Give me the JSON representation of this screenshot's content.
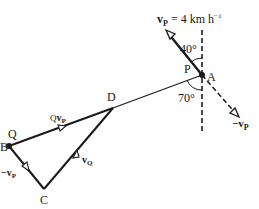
{
  "diagram": {
    "points": {
      "A": "A",
      "P": "P",
      "B": "B",
      "Q": "Q",
      "C": "C",
      "D": "D"
    },
    "labels": {
      "vp_eq_main": "v",
      "vp_eq_sub": "P",
      "vp_eq_value": " = 4 km h",
      "vp_eq_exp": "−1",
      "angle_top": "40°",
      "angle_bottom": "70°",
      "neg_vp_right_main": "−v",
      "neg_vp_right_sub": "P",
      "qvp_pre": "Q",
      "qvp_main": "v",
      "qvp_sub": "P",
      "vq_main": "v",
      "vq_sub": "Q",
      "neg_vp_left_main": "−v",
      "neg_vp_left_sub": "P"
    },
    "colors": {
      "line": "#1a1a1a",
      "background": "#ffffff"
    }
  }
}
